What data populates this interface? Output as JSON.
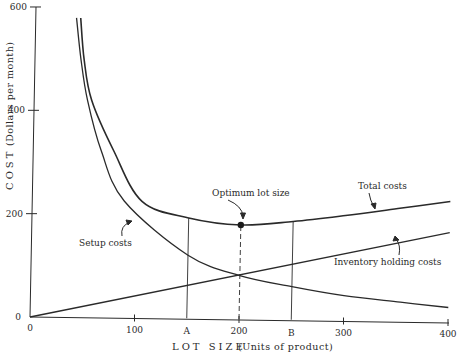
{
  "chart_data": {
    "type": "line",
    "title": "",
    "xlabel": "LOT SIZE  (Units of product)",
    "xlabel_main": "LOT SIZE",
    "xlabel_sub": "(Units of product)",
    "ylabel": "COST  (Dollars per month)",
    "ylabel_main": "COST",
    "ylabel_sub": "(Dollars per month)",
    "xlim": [
      0,
      400
    ],
    "ylim": [
      0,
      600
    ],
    "grid": false,
    "legend": "none (curves labeled directly)",
    "x_ticks": [
      {
        "value": 0,
        "label": "0"
      },
      {
        "value": 100,
        "label": "100"
      },
      {
        "value": 200,
        "label": "200"
      },
      {
        "value": 300,
        "label": "300"
      },
      {
        "value": 400,
        "label": "400"
      }
    ],
    "x_letter_ticks": [
      {
        "value": 150,
        "label": "A"
      },
      {
        "value": 250,
        "label": "B"
      }
    ],
    "y_ticks": [
      {
        "value": 0,
        "label": "0"
      },
      {
        "value": 200,
        "label": "200"
      },
      {
        "value": 400,
        "label": "400"
      },
      {
        "value": 600,
        "label": "600"
      }
    ],
    "series": [
      {
        "name": "Total costs",
        "x": [
          43,
          47,
          55,
          77,
          105,
          150,
          200,
          250,
          300,
          350,
          400
        ],
        "values": [
          580,
          500,
          421,
          324,
          227,
          196,
          184,
          192,
          205,
          220,
          235
        ]
      },
      {
        "name": "Setup costs",
        "x": [
          39,
          44,
          51,
          65,
          88,
          150,
          200,
          250,
          300,
          354,
          400
        ],
        "values": [
          580,
          500,
          421,
          324,
          227,
          124,
          86,
          66,
          50,
          39,
          30
        ]
      },
      {
        "name": "Inventory holding costs",
        "x": [
          0,
          400
        ],
        "values": [
          0,
          175
        ]
      }
    ],
    "reference_lines": [
      {
        "x": 150,
        "label": "A",
        "style": "solid",
        "from": 0,
        "to": 196
      },
      {
        "x": 200,
        "label": "200",
        "style": "dashed",
        "from": 0,
        "to": 184
      },
      {
        "x": 250,
        "label": "B",
        "style": "solid",
        "from": 0,
        "to": 192
      }
    ],
    "optimum_point": {
      "x": 200,
      "y": 184,
      "label": "Optimum lot size"
    },
    "annotations": [
      {
        "text": "Optimum lot size",
        "target_series": "Total costs",
        "target_x": 200
      },
      {
        "text": "Total costs",
        "target_series": "Total costs",
        "target_x": 298
      },
      {
        "text": "Setup costs",
        "target_series": "Setup costs",
        "target_x": 78
      },
      {
        "text": "Inventory holding costs",
        "target_series": "Inventory holding costs",
        "target_x": 316
      }
    ]
  },
  "labels": {
    "y_axis_title_main": "COST",
    "y_axis_title_sub": "(Dollars per month)",
    "x_axis_title_main": "LOT SIZE",
    "x_axis_title_sub": "(Units of product)",
    "optimum": "Optimum lot size",
    "total": "Total costs",
    "setup": "Setup costs",
    "inventory": "Inventory holding costs"
  },
  "style": {
    "ink": "#2a2a2a",
    "background": "#ffffff"
  }
}
